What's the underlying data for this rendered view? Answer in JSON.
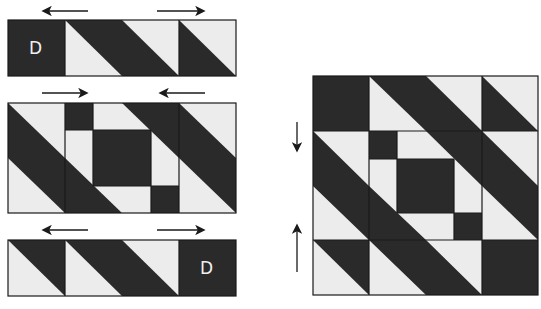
{
  "diagram": {
    "type": "quilt-block-assembly",
    "colors": {
      "dark": "#2a2a2a",
      "light": "#ececec",
      "outline": "#1a1a1a",
      "arrow": "#1a1a1a"
    },
    "rows": [
      {
        "name": "top-row",
        "label": "D",
        "label_position": "left",
        "press_arrows": [
          "left",
          "right"
        ]
      },
      {
        "name": "middle-row",
        "press_arrows": [
          "right",
          "left"
        ]
      },
      {
        "name": "bottom-row",
        "label": "D",
        "label_position": "right",
        "press_arrows": [
          "left",
          "right"
        ]
      }
    ],
    "assembled_block": {
      "name": "finished-block",
      "press_arrows": [
        "down",
        "up"
      ]
    }
  }
}
